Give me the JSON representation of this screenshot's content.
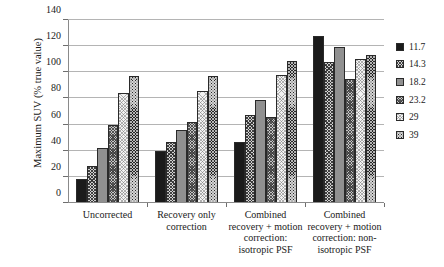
{
  "chart_data": {
    "type": "bar",
    "title": "",
    "xlabel": "",
    "ylabel": "Maximum SUV (% true value)",
    "ylim": [
      0,
      140
    ],
    "yticks": [
      0,
      20,
      40,
      60,
      80,
      100,
      120,
      140
    ],
    "ytick_labels": [
      "0",
      "20",
      "40",
      "60",
      "80",
      "100",
      "120",
      "140"
    ],
    "grid": true,
    "legend_position": "right",
    "legend_title": "",
    "categories": [
      "Uncorrected",
      "Recovery only correction",
      "Combined recovery + motion correction: isotropic PSF",
      "Combined recovery + motion correction: non-isotropic PSF"
    ],
    "category_lines": [
      [
        "Uncorrected"
      ],
      [
        "Recovery only",
        "correction"
      ],
      [
        "Combined",
        "recovery + motion",
        "correction:",
        "isotropic PSF"
      ],
      [
        "Combined",
        "recovery + motion",
        "correction: non-",
        "isotropic PSF"
      ]
    ],
    "series": [
      {
        "name": "11.7",
        "pattern": "solid-black",
        "color": "#1b1b1b",
        "values": [
          18,
          40,
          47,
          128
        ]
      },
      {
        "name": "14.3",
        "pattern": "fine-crosshatch",
        "color": "#cfcfcf",
        "values": [
          28,
          47,
          67,
          108
        ]
      },
      {
        "name": "18.2",
        "pattern": "solid-gray",
        "color": "#909090",
        "values": [
          42,
          56,
          79,
          119
        ]
      },
      {
        "name": "23.2",
        "pattern": "diagonal-hatch",
        "color": "#c4c4c4",
        "values": [
          60,
          62,
          66,
          95
        ]
      },
      {
        "name": "29",
        "pattern": "light-dotted",
        "color": "#f2f2f2",
        "values": [
          84,
          86,
          98,
          110
        ]
      },
      {
        "name": "39",
        "pattern": "dark-checkered",
        "color": "#262626",
        "values": [
          97,
          97,
          109,
          113
        ]
      }
    ]
  }
}
